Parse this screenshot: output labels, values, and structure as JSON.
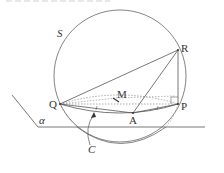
{
  "figure": {
    "labels": {
      "sphere": "S",
      "R": "R",
      "Q": "Q",
      "P": "P",
      "A": "A",
      "M": "M",
      "plane": "α",
      "circle": "C"
    },
    "stroke_color": "#555555",
    "dotted_color": "#888888"
  }
}
